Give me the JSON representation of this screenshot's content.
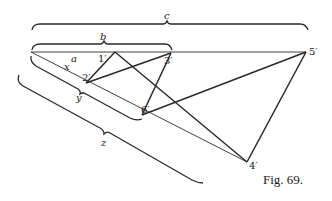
{
  "figure": {
    "caption": "Fig. 69.",
    "segment_labels": {
      "a": "a",
      "b": "b",
      "c": "c",
      "x": "x",
      "y": "y",
      "z": "z"
    },
    "points": {
      "p1": "1′",
      "p2": "2′",
      "p3": "3′",
      "p4": "4′",
      "p5": "5′",
      "p6": "6′"
    },
    "polygon_order": [
      "1′",
      "2′",
      "3′",
      "6′",
      "5′",
      "4′"
    ]
  }
}
